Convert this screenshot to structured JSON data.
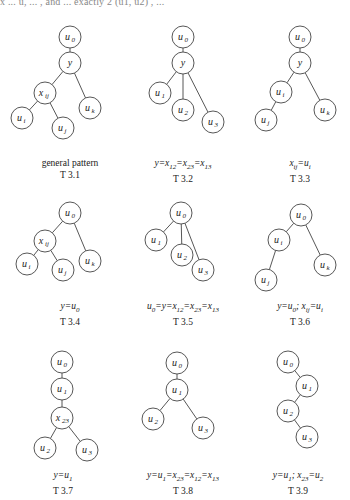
{
  "header": {
    "text_fragment": "x ... u, ... , and ... exactly 2 (u1, u2) , ..."
  },
  "node_radius": 11,
  "trees": [
    {
      "id": "T 3.1",
      "caption": "general pattern",
      "label": "T 3.1",
      "caption_pos": [
        70,
        165
      ],
      "nodes": [
        {
          "id": "u0",
          "label": "u",
          "sub": "0",
          "x": 70,
          "y": 37
        },
        {
          "id": "y",
          "label": "y",
          "sub": "",
          "x": 70,
          "y": 63
        },
        {
          "id": "xij",
          "label": "x",
          "sub": "ij",
          "x": 45,
          "y": 93
        },
        {
          "id": "uk",
          "label": "u",
          "sub": "k",
          "x": 90,
          "y": 108
        },
        {
          "id": "ui",
          "label": "u",
          "sub": "i",
          "x": 22,
          "y": 118
        },
        {
          "id": "uj",
          "label": "u",
          "sub": "j",
          "x": 63,
          "y": 128
        }
      ],
      "edges": [
        [
          "u0",
          "y"
        ],
        [
          "y",
          "xij"
        ],
        [
          "y",
          "uk"
        ],
        [
          "xij",
          "ui"
        ],
        [
          "xij",
          "uj"
        ]
      ]
    },
    {
      "id": "T 3.2",
      "caption": "y=x12=x23=x13",
      "label": "T 3.2",
      "caption_pos": [
        183,
        165
      ],
      "nodes": [
        {
          "id": "u0",
          "label": "u",
          "sub": "0",
          "x": 183,
          "y": 37
        },
        {
          "id": "y",
          "label": "y",
          "sub": "",
          "x": 183,
          "y": 63
        },
        {
          "id": "u1",
          "label": "u",
          "sub": "1",
          "x": 160,
          "y": 93
        },
        {
          "id": "u2",
          "label": "u",
          "sub": "2",
          "x": 183,
          "y": 110
        },
        {
          "id": "u3",
          "label": "u",
          "sub": "3",
          "x": 213,
          "y": 122
        }
      ],
      "edges": [
        [
          "u0",
          "y"
        ],
        [
          "y",
          "u1"
        ],
        [
          "y",
          "u2"
        ],
        [
          "y",
          "u3"
        ]
      ]
    },
    {
      "id": "T 3.3",
      "caption": "xij=ui",
      "label": "T 3.3",
      "caption_pos": [
        300,
        165
      ],
      "nodes": [
        {
          "id": "u0",
          "label": "u",
          "sub": "0",
          "x": 300,
          "y": 37
        },
        {
          "id": "y",
          "label": "y",
          "sub": "",
          "x": 300,
          "y": 63
        },
        {
          "id": "ui",
          "label": "u",
          "sub": "i",
          "x": 281,
          "y": 92
        },
        {
          "id": "uk",
          "label": "u",
          "sub": "k",
          "x": 325,
          "y": 110
        },
        {
          "id": "uj",
          "label": "u",
          "sub": "j",
          "x": 266,
          "y": 120
        }
      ],
      "edges": [
        [
          "u0",
          "y"
        ],
        [
          "y",
          "ui"
        ],
        [
          "y",
          "uk"
        ],
        [
          "ui",
          "uj"
        ]
      ]
    },
    {
      "id": "T 3.4",
      "caption": "y=u0",
      "label": "T 3.4",
      "caption_pos": [
        70,
        308
      ],
      "nodes": [
        {
          "id": "u0",
          "label": "u",
          "sub": "0",
          "x": 70,
          "y": 213
        },
        {
          "id": "xij",
          "label": "x",
          "sub": "ij",
          "x": 45,
          "y": 241
        },
        {
          "id": "uk",
          "label": "u",
          "sub": "k",
          "x": 90,
          "y": 261
        },
        {
          "id": "ui",
          "label": "u",
          "sub": "i",
          "x": 27,
          "y": 264
        },
        {
          "id": "uj",
          "label": "u",
          "sub": "j",
          "x": 63,
          "y": 270
        }
      ],
      "edges": [
        [
          "u0",
          "xij"
        ],
        [
          "u0",
          "uk"
        ],
        [
          "xij",
          "ui"
        ],
        [
          "xij",
          "uj"
        ]
      ]
    },
    {
      "id": "T 3.5",
      "caption": "u0=y=x12=x23=x13",
      "label": "T 3.5",
      "caption_pos": [
        183,
        308
      ],
      "nodes": [
        {
          "id": "u0",
          "label": "u",
          "sub": "0",
          "x": 181,
          "y": 213
        },
        {
          "id": "u1",
          "label": "u",
          "sub": "1",
          "x": 156,
          "y": 240
        },
        {
          "id": "u2",
          "label": "u",
          "sub": "2",
          "x": 182,
          "y": 255
        },
        {
          "id": "u3",
          "label": "u",
          "sub": "3",
          "x": 203,
          "y": 270
        }
      ],
      "edges": [
        [
          "u0",
          "u1"
        ],
        [
          "u0",
          "u2"
        ],
        [
          "u0",
          "u3"
        ]
      ]
    },
    {
      "id": "T 3.6",
      "caption": "y=u0; xij=ui",
      "label": "T 3.6",
      "caption_pos": [
        300,
        308
      ],
      "nodes": [
        {
          "id": "u0",
          "label": "u",
          "sub": "0",
          "x": 301,
          "y": 215
        },
        {
          "id": "ui",
          "label": "u",
          "sub": "i",
          "x": 279,
          "y": 240
        },
        {
          "id": "uk",
          "label": "u",
          "sub": "k",
          "x": 325,
          "y": 265
        },
        {
          "id": "uj",
          "label": "u",
          "sub": "j",
          "x": 266,
          "y": 280
        }
      ],
      "edges": [
        [
          "u0",
          "ui"
        ],
        [
          "u0",
          "uk"
        ],
        [
          "ui",
          "uj"
        ]
      ]
    },
    {
      "id": "T 3.7",
      "caption": "y=u1",
      "label": "T 3.7",
      "caption_pos": [
        63,
        477
      ],
      "nodes": [
        {
          "id": "u0",
          "label": "u",
          "sub": "0",
          "x": 62,
          "y": 362
        },
        {
          "id": "u1",
          "label": "u",
          "sub": "1",
          "x": 62,
          "y": 389
        },
        {
          "id": "x23",
          "label": "x",
          "sub": "23",
          "x": 62,
          "y": 418
        },
        {
          "id": "u2",
          "label": "u",
          "sub": "2",
          "x": 45,
          "y": 448
        },
        {
          "id": "u3",
          "label": "u",
          "sub": "3",
          "x": 87,
          "y": 450
        }
      ],
      "edges": [
        [
          "u0",
          "u1"
        ],
        [
          "u1",
          "x23"
        ],
        [
          "x23",
          "u2"
        ],
        [
          "x23",
          "u3"
        ]
      ]
    },
    {
      "id": "T 3.8",
      "caption": "y=u1=x23=x12=x13",
      "label": "T 3.8",
      "caption_pos": [
        183,
        477
      ],
      "nodes": [
        {
          "id": "u0",
          "label": "u",
          "sub": "0",
          "x": 177,
          "y": 363
        },
        {
          "id": "u1",
          "label": "u",
          "sub": "1",
          "x": 177,
          "y": 390
        },
        {
          "id": "u2",
          "label": "u",
          "sub": "2",
          "x": 153,
          "y": 419
        },
        {
          "id": "u3",
          "label": "u",
          "sub": "3",
          "x": 203,
          "y": 428
        }
      ],
      "edges": [
        [
          "u0",
          "u1"
        ],
        [
          "u1",
          "u2"
        ],
        [
          "u1",
          "u3"
        ]
      ]
    },
    {
      "id": "T 3.9",
      "caption": "y=u1; x23=u2",
      "label": "T 3.9",
      "caption_pos": [
        298,
        477
      ],
      "nodes": [
        {
          "id": "u0",
          "label": "u",
          "sub": "0",
          "x": 288,
          "y": 362
        },
        {
          "id": "u1",
          "label": "u",
          "sub": "1",
          "x": 307,
          "y": 386
        },
        {
          "id": "u2",
          "label": "u",
          "sub": "2",
          "x": 288,
          "y": 411
        },
        {
          "id": "u3",
          "label": "u",
          "sub": "3",
          "x": 307,
          "y": 437
        }
      ],
      "edges": [
        [
          "u0",
          "u1"
        ],
        [
          "u1",
          "u2"
        ],
        [
          "u2",
          "u3"
        ]
      ]
    }
  ],
  "captions_rich": [
    {
      "parts": [
        {
          "t": "general pattern"
        }
      ]
    },
    {
      "parts": [
        {
          "t": "y=x",
          "i": true
        },
        {
          "s": "12"
        },
        {
          "t": "=x",
          "i": true
        },
        {
          "s": "23"
        },
        {
          "t": "=x",
          "i": true
        },
        {
          "s": "13"
        }
      ]
    },
    {
      "parts": [
        {
          "t": "x",
          "i": true
        },
        {
          "s": "ij"
        },
        {
          "t": "=u",
          "i": true
        },
        {
          "s": "i"
        }
      ]
    },
    {
      "parts": [
        {
          "t": "y=u",
          "i": true
        },
        {
          "s": "0"
        }
      ]
    },
    {
      "parts": [
        {
          "t": "u",
          "i": true
        },
        {
          "s": "0"
        },
        {
          "t": "=y=x",
          "i": true
        },
        {
          "s": "12"
        },
        {
          "t": "=x",
          "i": true
        },
        {
          "s": "23"
        },
        {
          "t": "=x",
          "i": true
        },
        {
          "s": "13"
        }
      ]
    },
    {
      "parts": [
        {
          "t": "y=u",
          "i": true
        },
        {
          "s": "0"
        },
        {
          "t": "; x",
          "i": true
        },
        {
          "s": "ij"
        },
        {
          "t": "=u",
          "i": true
        },
        {
          "s": "i"
        }
      ]
    },
    {
      "parts": [
        {
          "t": "y=u",
          "i": true
        },
        {
          "s": "1"
        }
      ]
    },
    {
      "parts": [
        {
          "t": "y=u",
          "i": true
        },
        {
          "s": "1"
        },
        {
          "t": "=x",
          "i": true
        },
        {
          "s": "23"
        },
        {
          "t": "=x",
          "i": true
        },
        {
          "s": "12"
        },
        {
          "t": "=x",
          "i": true
        },
        {
          "s": "13"
        }
      ]
    },
    {
      "parts": [
        {
          "t": "y=u",
          "i": true
        },
        {
          "s": "1"
        },
        {
          "t": "; x",
          "i": true
        },
        {
          "s": "23"
        },
        {
          "t": "=u",
          "i": true
        },
        {
          "s": "2"
        }
      ]
    }
  ],
  "colors": {
    "stroke": "#444444",
    "text": "#222222",
    "background": "#ffffff"
  }
}
